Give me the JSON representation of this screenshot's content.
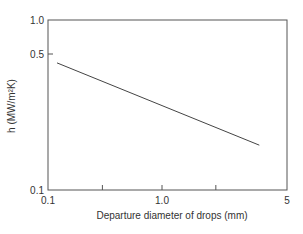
{
  "chart_data": {
    "type": "line",
    "title": "",
    "xlabel": "Departure diameter of drops (mm)",
    "ylabel": "h (MW/m²K)",
    "xscale": "log",
    "yscale": "log",
    "xlim": [
      0.1,
      5
    ],
    "ylim": [
      0.1,
      1.0
    ],
    "x_ticks": [
      {
        "value": 0.1,
        "label": "0.1"
      },
      {
        "value": 0.3,
        "label": ""
      },
      {
        "value": 1.0,
        "label": "1.0"
      },
      {
        "value": 2.0,
        "label": ""
      },
      {
        "value": 5,
        "label": "5"
      }
    ],
    "y_ticks": [
      {
        "value": 0.1,
        "label": "0.1"
      },
      {
        "value": 0.5,
        "label": "0.5"
      },
      {
        "value": 1.0,
        "label": "1.0"
      }
    ],
    "grid": false,
    "legend": "none",
    "series": [
      {
        "name": "h",
        "x": [
          0.12,
          3.5
        ],
        "y": [
          0.45,
          0.17
        ]
      }
    ]
  }
}
